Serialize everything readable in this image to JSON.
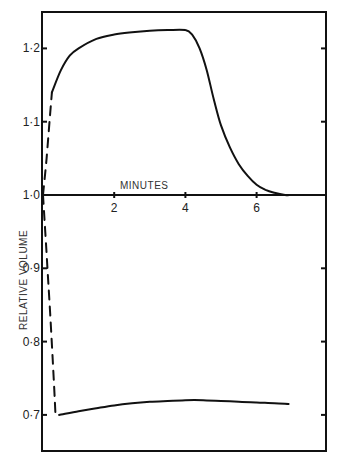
{
  "chart_data": {
    "type": "line",
    "title": "",
    "xlabel": "MINUTES",
    "ylabel": "RELATIVE VOLUME",
    "xlim": [
      0,
      8
    ],
    "ylim": [
      0.65,
      1.25
    ],
    "grid": false,
    "legend": null,
    "x_ticks": [
      {
        "value": 2,
        "label": "2"
      },
      {
        "value": 4,
        "label": "4"
      },
      {
        "value": 6,
        "label": "6"
      }
    ],
    "y_ticks": [
      {
        "value": 1.2,
        "label": "1·2"
      },
      {
        "value": 1.1,
        "label": "1·1"
      },
      {
        "value": 1.0,
        "label": "1·0"
      },
      {
        "value": 0.9,
        "label": "0·9"
      },
      {
        "value": 0.8,
        "label": "0·8"
      },
      {
        "value": 0.7,
        "label": "0·7"
      }
    ],
    "series": [
      {
        "name": "swelling (dashed initial phase)",
        "style": "dashed",
        "x": [
          0.0,
          0.1,
          0.2,
          0.25
        ],
        "y": [
          1.0,
          1.05,
          1.11,
          1.14
        ]
      },
      {
        "name": "swelling",
        "style": "solid",
        "x": [
          0.25,
          0.5,
          0.75,
          1.0,
          1.5,
          2.0,
          2.5,
          3.0,
          3.5,
          4.0,
          4.2,
          4.4,
          4.6,
          4.8,
          5.0,
          5.25,
          5.5,
          5.75,
          6.0,
          6.25,
          6.5,
          6.8,
          7.0,
          7.3
        ],
        "y": [
          1.14,
          1.17,
          1.19,
          1.2,
          1.213,
          1.219,
          1.222,
          1.224,
          1.225,
          1.225,
          1.218,
          1.2,
          1.17,
          1.13,
          1.095,
          1.065,
          1.042,
          1.026,
          1.014,
          1.007,
          1.003,
          1.0,
          1.0,
          1.0
        ]
      },
      {
        "name": "shrinking (dashed initial phase)",
        "style": "dashed",
        "x": [
          0.0,
          0.1,
          0.2,
          0.3,
          0.35
        ],
        "y": [
          1.0,
          0.92,
          0.84,
          0.75,
          0.7
        ]
      },
      {
        "name": "shrinking",
        "style": "solid",
        "x": [
          0.45,
          1.0,
          1.5,
          2.0,
          2.5,
          3.0,
          3.5,
          4.0,
          4.5,
          5.0,
          5.5,
          6.0,
          6.5,
          6.9
        ],
        "y": [
          0.7,
          0.705,
          0.709,
          0.713,
          0.716,
          0.718,
          0.719,
          0.72,
          0.72,
          0.719,
          0.718,
          0.717,
          0.716,
          0.715
        ]
      }
    ],
    "layout": {
      "frame": {
        "left": 42,
        "top": 12,
        "right": 326,
        "bottom": 451
      },
      "x_origin_px": 43,
      "px_per_minute": 35.6,
      "y_value_1_0_px": 195,
      "px_per_0_1": 73.3,
      "stroke_color": "#111111"
    }
  }
}
